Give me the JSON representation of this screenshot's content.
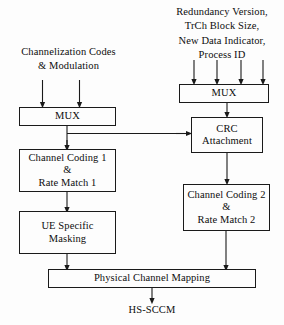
{
  "diagram": {
    "output_label": "HS-SCCM",
    "line_color": "#1a1a1a",
    "background_color": "#fdfdfd",
    "labels": {
      "left_input": {
        "lines": [
          "Channelization Codes",
          "& Modulation"
        ]
      },
      "right_input": {
        "lines": [
          "Redundancy Version,",
          "TrCh Block Size,",
          "New Data Indicator,",
          "Process ID"
        ]
      }
    },
    "nodes": [
      {
        "id": "mux-left",
        "lines": [
          "MUX"
        ]
      },
      {
        "id": "mux-right",
        "lines": [
          "MUX"
        ]
      },
      {
        "id": "crc-attachment",
        "lines": [
          "CRC",
          "Attachment"
        ]
      },
      {
        "id": "channel-coding-1",
        "lines": [
          "Channel Coding 1",
          "&",
          "Rate Match 1"
        ]
      },
      {
        "id": "channel-coding-2",
        "lines": [
          "Channel Coding 2",
          "&",
          "Rate Match 2"
        ]
      },
      {
        "id": "ue-specific-masking",
        "lines": [
          "UE Specific",
          "Masking"
        ]
      },
      {
        "id": "physical-channel-mapping",
        "lines": [
          "Physical Channel Mapping"
        ]
      }
    ]
  }
}
